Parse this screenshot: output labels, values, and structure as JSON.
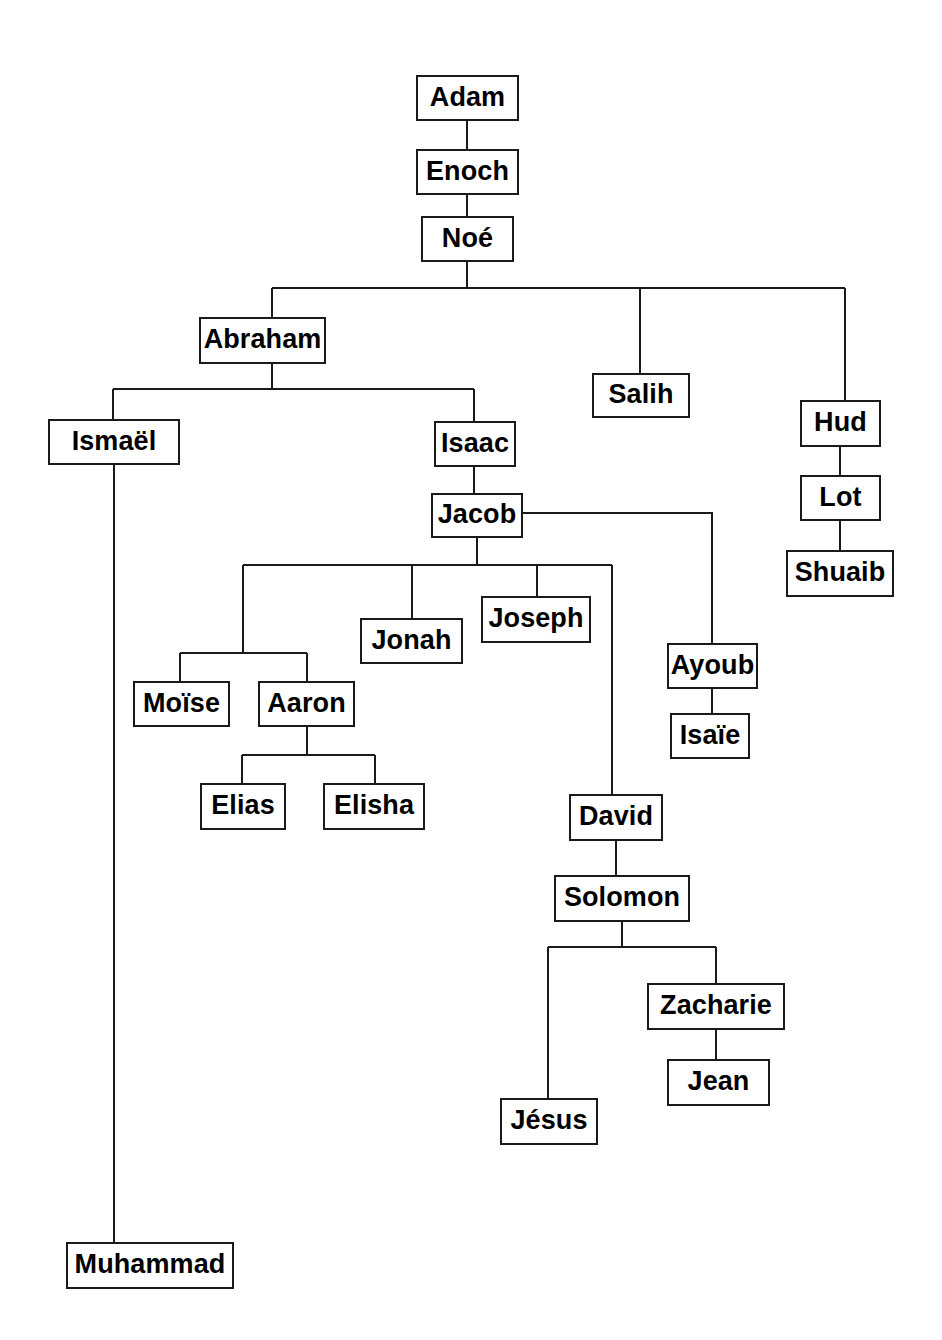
{
  "diagram": {
    "type": "tree",
    "background_color": "#ffffff",
    "node_border_color": "#1a1a1a",
    "node_fill_color": "#ffffff",
    "edge_color": "#1a1a1a",
    "text_color": "#000000",
    "nodes": [
      {
        "id": "adam",
        "label": "Adam",
        "x": 416,
        "y": 75,
        "w": 103,
        "h": 46
      },
      {
        "id": "enoch",
        "label": "Enoch",
        "x": 416,
        "y": 149,
        "w": 103,
        "h": 46
      },
      {
        "id": "noe",
        "label": "Noé",
        "x": 421,
        "y": 216,
        "w": 93,
        "h": 46
      },
      {
        "id": "abraham",
        "label": "Abraham",
        "x": 199,
        "y": 317,
        "w": 127,
        "h": 47
      },
      {
        "id": "salih",
        "label": "Salih",
        "x": 592,
        "y": 373,
        "w": 98,
        "h": 45
      },
      {
        "id": "hud",
        "label": "Hud",
        "x": 800,
        "y": 400,
        "w": 81,
        "h": 47
      },
      {
        "id": "ismael",
        "label": "Ismaël",
        "x": 48,
        "y": 419,
        "w": 132,
        "h": 46
      },
      {
        "id": "isaac",
        "label": "Isaac",
        "x": 434,
        "y": 421,
        "w": 82,
        "h": 46
      },
      {
        "id": "lot",
        "label": "Lot",
        "x": 800,
        "y": 475,
        "w": 81,
        "h": 46
      },
      {
        "id": "jacob",
        "label": "Jacob",
        "x": 431,
        "y": 493,
        "w": 92,
        "h": 45
      },
      {
        "id": "shuaib",
        "label": "Shuaib",
        "x": 786,
        "y": 550,
        "w": 108,
        "h": 47
      },
      {
        "id": "joseph",
        "label": "Joseph",
        "x": 481,
        "y": 596,
        "w": 110,
        "h": 47
      },
      {
        "id": "jonah",
        "label": "Jonah",
        "x": 360,
        "y": 618,
        "w": 103,
        "h": 46
      },
      {
        "id": "ayoub",
        "label": "Ayoub",
        "x": 667,
        "y": 643,
        "w": 91,
        "h": 46
      },
      {
        "id": "moise",
        "label": "Moïse",
        "x": 133,
        "y": 681,
        "w": 97,
        "h": 46
      },
      {
        "id": "aaron",
        "label": "Aaron",
        "x": 258,
        "y": 681,
        "w": 97,
        "h": 46
      },
      {
        "id": "isaie",
        "label": "Isaïe",
        "x": 670,
        "y": 713,
        "w": 80,
        "h": 46
      },
      {
        "id": "elias",
        "label": "Elias",
        "x": 200,
        "y": 783,
        "w": 86,
        "h": 47
      },
      {
        "id": "elisha",
        "label": "Elisha",
        "x": 323,
        "y": 783,
        "w": 102,
        "h": 47
      },
      {
        "id": "david",
        "label": "David",
        "x": 569,
        "y": 794,
        "w": 94,
        "h": 47
      },
      {
        "id": "solomon",
        "label": "Solomon",
        "x": 554,
        "y": 875,
        "w": 136,
        "h": 47
      },
      {
        "id": "zacharie",
        "label": "Zacharie",
        "x": 647,
        "y": 983,
        "w": 138,
        "h": 47
      },
      {
        "id": "jean",
        "label": "Jean",
        "x": 667,
        "y": 1059,
        "w": 103,
        "h": 47
      },
      {
        "id": "jesus",
        "label": "Jésus",
        "x": 500,
        "y": 1098,
        "w": 98,
        "h": 47
      },
      {
        "id": "muhammad",
        "label": "Muhammad",
        "x": 66,
        "y": 1242,
        "w": 168,
        "h": 47
      }
    ],
    "edges": [
      {
        "id": "adam-enoch",
        "from": "adam",
        "to": "enoch"
      },
      {
        "id": "enoch-noe",
        "from": "enoch",
        "to": "noe"
      },
      {
        "id": "noe-abraham",
        "from": "noe",
        "to": "abraham"
      },
      {
        "id": "noe-salih",
        "from": "noe",
        "to": "salih"
      },
      {
        "id": "noe-hud",
        "from": "noe",
        "to": "hud"
      },
      {
        "id": "abraham-ismael",
        "from": "abraham",
        "to": "ismael"
      },
      {
        "id": "abraham-isaac",
        "from": "abraham",
        "to": "isaac"
      },
      {
        "id": "isaac-jacob",
        "from": "isaac",
        "to": "jacob"
      },
      {
        "id": "hud-lot",
        "from": "hud",
        "to": "lot"
      },
      {
        "id": "lot-shuaib",
        "from": "lot",
        "to": "shuaib"
      },
      {
        "id": "jacob-moise",
        "from": "jacob",
        "to": "moise"
      },
      {
        "id": "jacob-aaron",
        "from": "jacob",
        "to": "aaron"
      },
      {
        "id": "jacob-jonah",
        "from": "jacob",
        "to": "jonah"
      },
      {
        "id": "jacob-joseph",
        "from": "jacob",
        "to": "joseph"
      },
      {
        "id": "jacob-david",
        "from": "jacob",
        "to": "david"
      },
      {
        "id": "jacob-ayoub",
        "from": "jacob",
        "to": "ayoub"
      },
      {
        "id": "ayoub-isaie",
        "from": "ayoub",
        "to": "isaie"
      },
      {
        "id": "aaron-elias",
        "from": "aaron",
        "to": "elias"
      },
      {
        "id": "aaron-elisha",
        "from": "aaron",
        "to": "elisha"
      },
      {
        "id": "david-solomon",
        "from": "david",
        "to": "solomon"
      },
      {
        "id": "solomon-jesus",
        "from": "solomon",
        "to": "jesus"
      },
      {
        "id": "solomon-zacharie",
        "from": "solomon",
        "to": "zacharie"
      },
      {
        "id": "zacharie-jean",
        "from": "zacharie",
        "to": "jean"
      },
      {
        "id": "ismael-muhammad",
        "from": "ismael",
        "to": "muhammad"
      }
    ]
  }
}
